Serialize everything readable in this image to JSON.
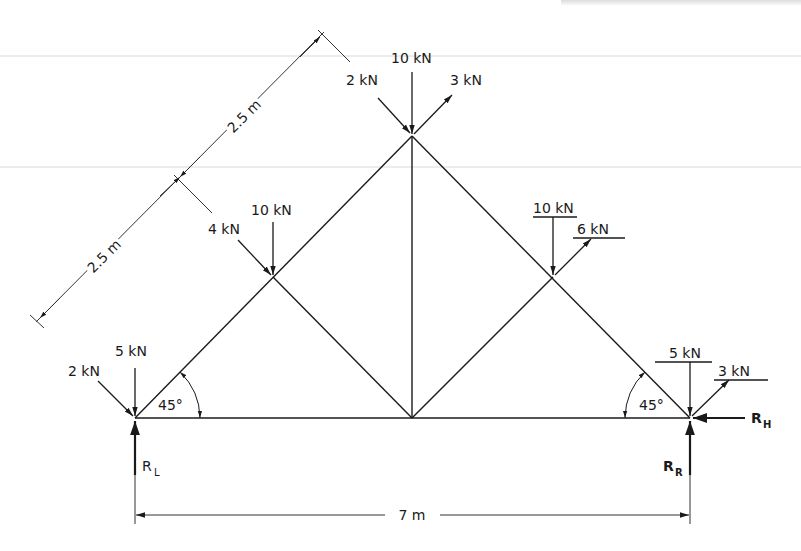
{
  "diagram": {
    "type": "truss-free-body-diagram",
    "span_label": "7 m",
    "panel_labels": [
      "2.5 m",
      "2.5 m"
    ],
    "angle_labels": {
      "left": "45°",
      "right": "45°"
    },
    "nodes": {
      "left_support": {
        "loads": [
          {
            "label": "2 kN",
            "direction": "down-right"
          },
          {
            "label": "5 kN",
            "direction": "down"
          }
        ],
        "reaction": "R",
        "reaction_sub": "L"
      },
      "left_upper": {
        "loads": [
          {
            "label": "4 kN",
            "direction": "down-right"
          },
          {
            "label": "10 kN",
            "direction": "down"
          }
        ]
      },
      "apex": {
        "loads": [
          {
            "label": "2 kN",
            "direction": "down-right"
          },
          {
            "label": "10 kN",
            "direction": "down"
          },
          {
            "label": "3 kN",
            "direction": "up-right"
          }
        ]
      },
      "right_upper": {
        "loads": [
          {
            "label": "10 kN",
            "direction": "down"
          },
          {
            "label": "6 kN",
            "direction": "up-right"
          }
        ]
      },
      "right_support": {
        "loads": [
          {
            "label": "5 kN",
            "direction": "down"
          },
          {
            "label": "3 kN",
            "direction": "up-right"
          }
        ],
        "reaction_v": "R",
        "reaction_v_sub": "R",
        "reaction_h": "R",
        "reaction_h_sub": "H"
      }
    }
  },
  "colors": {
    "line": "#1a1a1a",
    "thin": "#333333",
    "background": "#ffffff"
  }
}
